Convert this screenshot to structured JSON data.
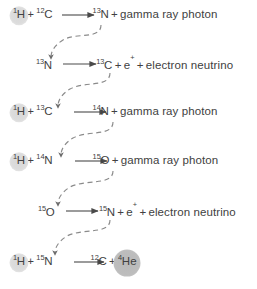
{
  "diagram": {
    "accent_highlight_color": "#dcdcdc",
    "accent_highlight_color_strong": "#bdbdbd",
    "text_color": "#414141",
    "arrow_color": "#5a5a5a",
    "reactions": [
      {
        "id": "reaction-1",
        "reactants": [
          {
            "mass": "1",
            "symbol": "H",
            "highlight": "light"
          },
          {
            "mass": "12",
            "symbol": "C",
            "highlight": "none"
          }
        ],
        "products_lead": {
          "mass": "13",
          "symbol": "N",
          "highlight": "none"
        },
        "products_tail": "+ gamma ray photon"
      },
      {
        "id": "reaction-2",
        "reactants": [
          {
            "mass": "13",
            "symbol": "N",
            "highlight": "none"
          }
        ],
        "products_lead": {
          "mass": "13",
          "symbol": "C",
          "highlight": "none"
        },
        "products_tail": "+ e+ + electron neutrino"
      },
      {
        "id": "reaction-3",
        "reactants": [
          {
            "mass": "1",
            "symbol": "H",
            "highlight": "light"
          },
          {
            "mass": "13",
            "symbol": "C",
            "highlight": "none"
          }
        ],
        "products_lead": {
          "mass": "14",
          "symbol": "N",
          "highlight": "none"
        },
        "products_tail": "+ gamma ray photon"
      },
      {
        "id": "reaction-4",
        "reactants": [
          {
            "mass": "1",
            "symbol": "H",
            "highlight": "light"
          },
          {
            "mass": "14",
            "symbol": "N",
            "highlight": "none"
          }
        ],
        "products_lead": {
          "mass": "15",
          "symbol": "O",
          "highlight": "none"
        },
        "products_tail": "+ gamma ray photon"
      },
      {
        "id": "reaction-5",
        "reactants": [
          {
            "mass": "15",
            "symbol": "O",
            "highlight": "none"
          }
        ],
        "products_lead": {
          "mass": "15",
          "symbol": "N",
          "highlight": "none"
        },
        "products_tail": "+ e+ + electron neutrino"
      },
      {
        "id": "reaction-6",
        "reactants": [
          {
            "mass": "1",
            "symbol": "H",
            "highlight": "light"
          },
          {
            "mass": "15",
            "symbol": "N",
            "highlight": "none"
          }
        ],
        "products_lead": {
          "mass": "12",
          "symbol": "C",
          "highlight": "none"
        },
        "products_tail": "+ 4He",
        "products_extra": {
          "mass": "4",
          "symbol": "He",
          "highlight": "strong"
        }
      }
    ],
    "labels": {
      "plus": "+",
      "gamma_ray_photon": "gamma ray photon",
      "electron_neutrino": "electron neutrino",
      "positron": "e",
      "positron_charge": "+"
    },
    "rows": [
      {
        "n": 1,
        "r1_mass": "1",
        "r1_sym": "H",
        "r2_mass": "12",
        "r2_sym": "C",
        "p_mass": "13",
        "p_sym": "N",
        "tail": "gamma ray photon"
      },
      {
        "n": 2,
        "r1_mass": "13",
        "r1_sym": "N",
        "p_mass": "13",
        "p_sym": "C",
        "tail": "electron neutrino"
      },
      {
        "n": 3,
        "r1_mass": "1",
        "r1_sym": "H",
        "r2_mass": "13",
        "r2_sym": "C",
        "p_mass": "14",
        "p_sym": "N",
        "tail": "gamma ray photon"
      },
      {
        "n": 4,
        "r1_mass": "1",
        "r1_sym": "H",
        "r2_mass": "14",
        "r2_sym": "N",
        "p_mass": "15",
        "p_sym": "O",
        "tail": "gamma ray photon"
      },
      {
        "n": 5,
        "r1_mass": "15",
        "r1_sym": "O",
        "p_mass": "15",
        "p_sym": "N",
        "tail": "electron neutrino"
      },
      {
        "n": 6,
        "r1_mass": "1",
        "r1_sym": "H",
        "r2_mass": "15",
        "r2_sym": "N",
        "p_mass": "12",
        "p_sym": "C",
        "tail": "4He"
      }
    ]
  }
}
